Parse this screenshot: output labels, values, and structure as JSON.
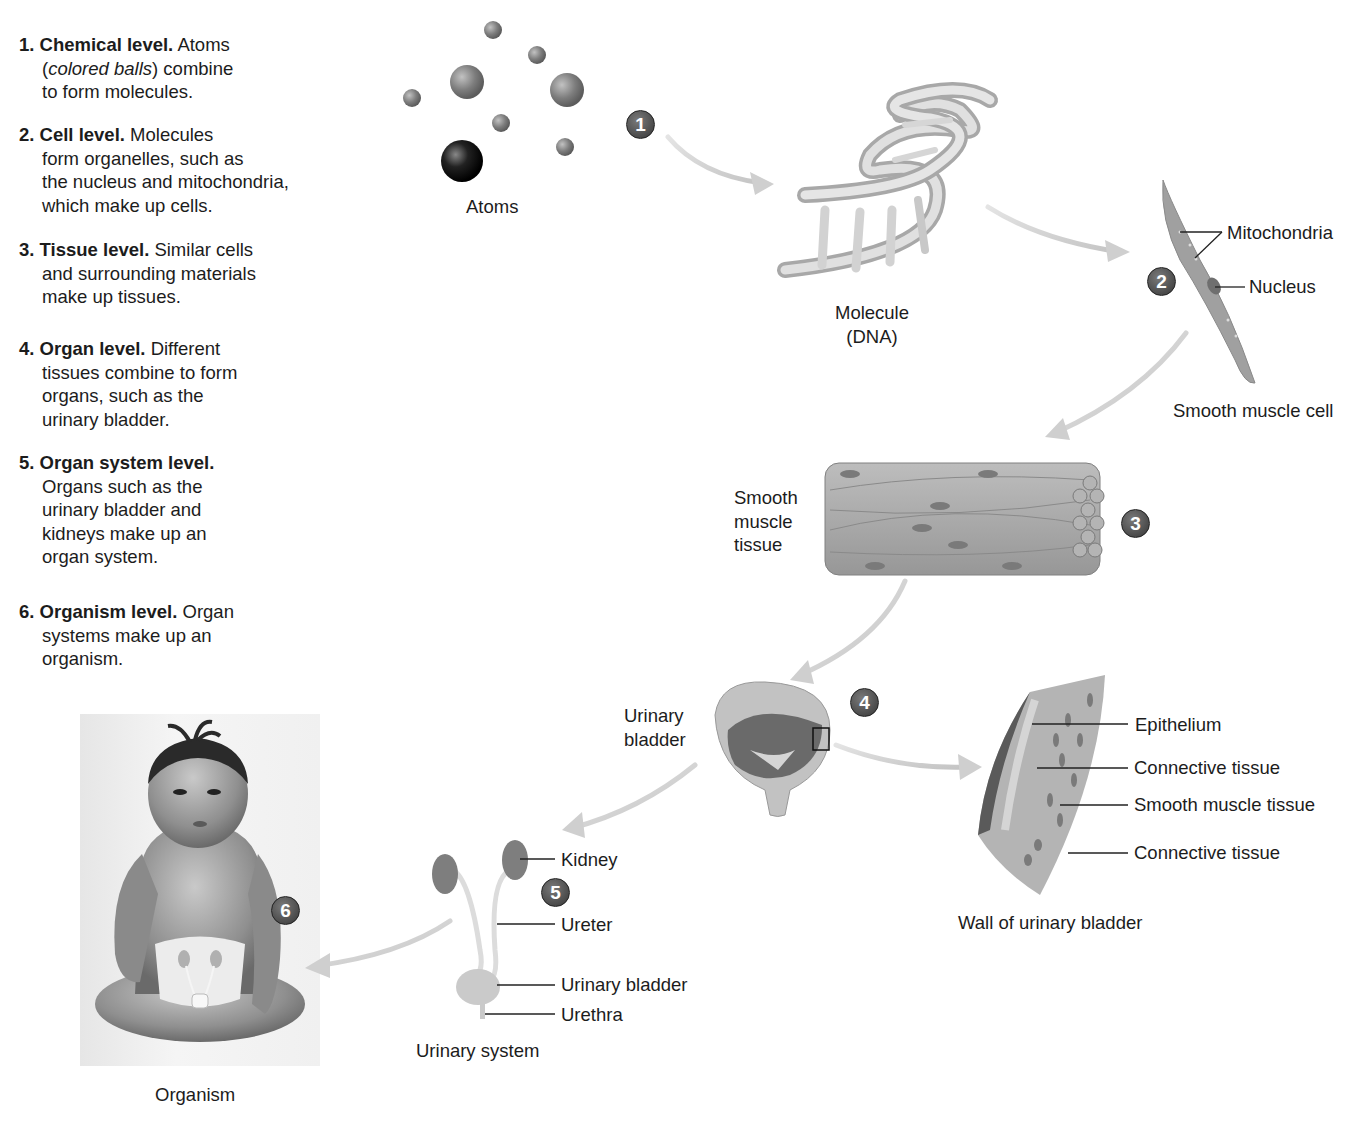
{
  "levels": [
    {
      "num": "1.",
      "title": "Chemical level.",
      "text_lines": [
        "Atoms",
        "(",
        "colored balls",
        ") combine",
        "to form molecules."
      ]
    },
    {
      "num": "2.",
      "title": "Cell level.",
      "text_lines": [
        "Molecules",
        "form organelles, such as",
        "the nucleus and mitochondria,",
        "which make up cells."
      ]
    },
    {
      "num": "3.",
      "title": "Tissue level.",
      "text_lines": [
        "Similar cells",
        "and surrounding materials",
        "make up tissues."
      ]
    },
    {
      "num": "4.",
      "title": "Organ level.",
      "text_lines": [
        "Different",
        "tissues combine to form",
        "organs, such as the",
        "urinary bladder."
      ]
    },
    {
      "num": "5.",
      "title": "Organ system level.",
      "text_lines": [
        "",
        "Organs such as the",
        "urinary bladder and",
        "kidneys make up an",
        "organ system."
      ]
    },
    {
      "num": "6.",
      "title": "Organism level.",
      "text_lines": [
        "Organ",
        "systems make up an",
        "organism."
      ]
    }
  ],
  "badges": [
    "1",
    "2",
    "3",
    "4",
    "5",
    "6"
  ],
  "figures": {
    "atoms": {
      "label": "Atoms"
    },
    "molecule": {
      "label_line1": "Molecule",
      "label_line2": "(DNA)"
    },
    "cell": {
      "label": "Smooth muscle cell",
      "callouts": [
        "Mitochondria",
        "Nucleus"
      ]
    },
    "tissue": {
      "label_lines": [
        "Smooth",
        "muscle",
        "tissue"
      ]
    },
    "organ": {
      "label_lines": [
        "Urinary",
        "bladder"
      ]
    },
    "wall": {
      "label": "Wall of urinary bladder",
      "callouts": [
        "Epithelium",
        "Connective tissue",
        "Smooth muscle tissue",
        "Connective tissue"
      ]
    },
    "system": {
      "label": "Urinary system",
      "callouts": [
        "Kidney",
        "Ureter",
        "Urinary bladder",
        "Urethra"
      ]
    },
    "organism": {
      "label": "Organism"
    }
  },
  "colors": {
    "badge": "#4a4a4a",
    "arrow": "#cfcfcf",
    "text": "#1c1c1c",
    "tissue": "#a9a9a9"
  }
}
